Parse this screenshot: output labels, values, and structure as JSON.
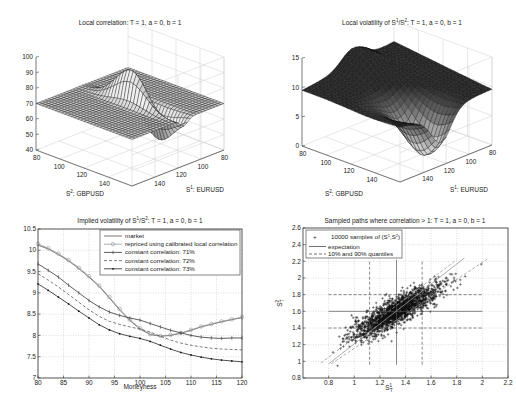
{
  "figure": {
    "panels": [
      "local-correlation-surface",
      "local-volatility-surface",
      "implied-volatility",
      "sampled-paths"
    ]
  },
  "chart_data": [
    {
      "type": "surface",
      "title": "Local correlation: T = 1, a = 0, b = 1",
      "xlabel": "S¹: EURUSD",
      "ylabel": "S²: GBPUSD",
      "zlabel": "",
      "x_ticks": [
        "80",
        "100",
        "120",
        "140"
      ],
      "y_ticks": [
        "80",
        "100",
        "120",
        "140"
      ],
      "z_ticks": [
        "40",
        "50",
        "60",
        "70",
        "80",
        "90",
        "100"
      ],
      "zlim": [
        40,
        100
      ],
      "grid": true,
      "description": "Flat plateau near 70 with a sharp ridge peaking ~96 and trough ~47 along the diagonal near S1=S2=~110",
      "base_level": 70,
      "peak": 96,
      "trough": 47
    },
    {
      "type": "surface",
      "title": "Local volatility of S¹/S²: T = 1, a = 0, b = 1",
      "xlabel": "S¹: EURUSD",
      "ylabel": "S²: GBPUSD",
      "x_ticks": [
        "80",
        "100",
        "120",
        "140"
      ],
      "y_ticks": [
        "80",
        "100",
        "120",
        "140"
      ],
      "z_ticks": [
        "0",
        "5",
        "10",
        "15"
      ],
      "zlim": [
        0,
        15
      ],
      "grid": true,
      "description": "Surface around 9-12 at edges, elevated ridge ~14 at far side, dip to ~2 near centre front",
      "base_level": 9.5,
      "peak": 14,
      "trough": 2
    },
    {
      "type": "line",
      "title": "Implied volatility of S¹/S²: T = 1, a = 0, b = 1",
      "xlabel": "Moneyness",
      "ylabel": "",
      "xlim": [
        80,
        120
      ],
      "ylim": [
        7,
        10.5
      ],
      "x_ticks": [
        "80",
        "85",
        "90",
        "95",
        "100",
        "105",
        "110",
        "115",
        "120"
      ],
      "y_ticks": [
        "7",
        "7.5",
        "8",
        "8.5",
        "9",
        "9.5",
        "10",
        "10.5"
      ],
      "grid": true,
      "legend_position": "upper right",
      "x": [
        80,
        82,
        84,
        86,
        88,
        90,
        92,
        94,
        96,
        98,
        100,
        102,
        104,
        106,
        108,
        110,
        112,
        114,
        116,
        118,
        120
      ],
      "series": [
        {
          "name": "market",
          "style": "solid",
          "values": [
            10.12,
            10.03,
            9.9,
            9.75,
            9.57,
            9.37,
            9.15,
            8.88,
            8.6,
            8.35,
            8.15,
            8.02,
            7.98,
            8.0,
            8.05,
            8.12,
            8.2,
            8.26,
            8.32,
            8.37,
            8.42
          ]
        },
        {
          "name": "repriced using calibrated local correlation",
          "style": "circle",
          "values": [
            10.15,
            10.05,
            9.92,
            9.77,
            9.59,
            9.39,
            9.17,
            8.9,
            8.62,
            8.37,
            8.17,
            8.03,
            7.99,
            8.01,
            8.06,
            8.13,
            8.21,
            8.27,
            8.33,
            8.38,
            8.43
          ]
        },
        {
          "name": "constant correlation: 71%",
          "style": "plus",
          "values": [
            9.68,
            9.53,
            9.37,
            9.18,
            9.0,
            8.82,
            8.67,
            8.55,
            8.47,
            8.41,
            8.36,
            8.28,
            8.2,
            8.12,
            8.06,
            8.0,
            7.96,
            7.94,
            7.93,
            7.94,
            7.94
          ]
        },
        {
          "name": "constant correlation: 72%",
          "style": "dashed",
          "values": [
            9.45,
            9.3,
            9.14,
            8.96,
            8.78,
            8.6,
            8.45,
            8.33,
            8.26,
            8.2,
            8.15,
            8.08,
            7.98,
            7.89,
            7.82,
            7.77,
            7.73,
            7.7,
            7.68,
            7.67,
            7.66
          ]
        },
        {
          "name": "constant correlation: 73%",
          "style": "dot",
          "values": [
            9.21,
            9.06,
            8.9,
            8.74,
            8.57,
            8.41,
            8.25,
            8.13,
            8.04,
            7.98,
            7.93,
            7.86,
            7.77,
            7.68,
            7.6,
            7.54,
            7.49,
            7.45,
            7.42,
            7.4,
            7.38
          ]
        }
      ]
    },
    {
      "type": "scatter",
      "title": "Sampled paths where correlation > 1: T = 1, a = 0, b = 1",
      "xlabel": "S¹_T",
      "ylabel": "S²_T",
      "xlim": [
        0.6,
        2.2
      ],
      "ylim": [
        0.8,
        2.6
      ],
      "x_ticks": [
        "0.8",
        "1",
        "1.2",
        "1.4",
        "1.6",
        "1.8",
        "2",
        "2.2"
      ],
      "y_ticks": [
        "0.8",
        "1",
        "1.2",
        "1.4",
        "1.6",
        "1.8",
        "2",
        "2.2",
        "2.4",
        "2.6"
      ],
      "grid": true,
      "legend_position": "upper left",
      "legend": [
        "10000 samples of (S¹_T, S²_T)",
        "expectation",
        "10% and 90% quantiles"
      ],
      "n_samples": 10000,
      "cloud": {
        "center": [
          1.33,
          1.6
        ],
        "x_range": [
          0.75,
          2.0
        ],
        "y_range": [
          0.95,
          2.25
        ]
      },
      "expectation": {
        "x": 1.33,
        "y": 1.6
      },
      "quantiles": {
        "x10": 1.12,
        "x90": 1.53,
        "y10": 1.4,
        "y90": 1.8
      },
      "diagonal_lines": [
        {
          "style": "solid",
          "from": [
            0.8,
            0.97
          ],
          "to": [
            1.86,
            2.24
          ]
        },
        {
          "style": "dashed",
          "from": [
            0.74,
            0.98
          ],
          "to": [
            1.8,
            2.22
          ]
        },
        {
          "style": "dashed",
          "from": [
            0.82,
            0.97
          ],
          "to": [
            2.05,
            2.24
          ]
        }
      ]
    }
  ],
  "labels": {
    "p1_title": "Local correlation: T = 1, a = 0, b = 1",
    "p2_title_a": "Local volatility of S",
    "p2_title_b": "/S",
    "p2_title_c": ": T = 1, a = 0, b = 1",
    "p3_title_a": "Implied volatility of S",
    "p3_title_b": "/S",
    "p3_title_c": ": T = 1, a = 0, b = 1",
    "p4_title": "Sampled paths where correlation > 1: T = 1, a = 0, b = 1",
    "sup1": "1",
    "sup2": "2",
    "s2_label": ": GBPUSD",
    "s1_label": ": EURUSD",
    "moneyness": "Moneyness",
    "leg3": [
      "market",
      "repriced using calibrated local correlation",
      "constant correlation: 71%",
      "constant correlation: 72%",
      "constant correlation: 73%"
    ],
    "leg4_a": "10000 samples of (S",
    "leg4_b": "expectation",
    "leg4_c": "10% and 90% quantiles"
  }
}
